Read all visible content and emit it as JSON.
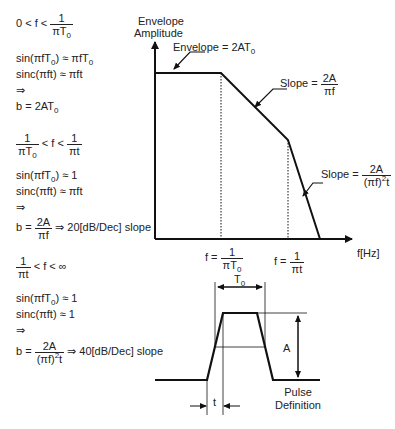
{
  "left_panel": {
    "region1": {
      "condition": {
        "lhs": "0 < f <",
        "num": "1",
        "den": "πT",
        "den_sub": "0"
      },
      "line1": {
        "pre": "sin(πfT",
        "sub1": "0",
        "mid": ") ≈ πfT",
        "sub2": "0"
      },
      "line2": "sinc(πft) ≈ πft",
      "implies": "⇒",
      "result": {
        "pre": "b = 2AT",
        "sub": "0"
      }
    },
    "region2": {
      "condition": {
        "num1": "1",
        "den1": "πT",
        "den1_sub": "0",
        "mid": "< f <",
        "num2": "1",
        "den2": "πt"
      },
      "line1": {
        "pre": "sin(πfT",
        "sub": "0",
        "post": ") ≈ 1"
      },
      "line2": "sinc(πft) ≈ πft",
      "implies": "⇒",
      "result": {
        "pre": "b =",
        "num": "2A",
        "den": "πf",
        "post": "⇒ 20[dB/Dec] slope"
      }
    },
    "region3": {
      "condition": {
        "num": "1",
        "den": "πt",
        "post": "< f < ∞"
      },
      "line1": {
        "pre": "sin(πfT",
        "sub": "0",
        "post": ") ≈ 1"
      },
      "line2": "sinc(πft) ≈ 1",
      "implies": "⇒",
      "result": {
        "pre": "b =",
        "num": "2A",
        "den": "(πf)",
        "den_sup": "2",
        "den_post": "t",
        "post": "⇒ 40[dB/Dec] slope"
      }
    }
  },
  "chart": {
    "y_axis_label_1": "Envelope",
    "y_axis_label_2": "Amplitude",
    "x_axis_label": "f[Hz]",
    "envelope_label": {
      "pre": "Envelope = 2AT",
      "sub": "0"
    },
    "slope1_label": {
      "pre": "Slope =",
      "num": "2A",
      "den": "πf"
    },
    "slope2_label": {
      "pre": "Slope =",
      "num": "2A",
      "den": "(πf)",
      "den_sup": "2",
      "den_post": "t"
    },
    "corner1": {
      "pre": "f =",
      "num": "1",
      "den": "πT",
      "den_sub": "0"
    },
    "corner2": {
      "pre": "f =",
      "num": "1",
      "den": "πt"
    }
  },
  "pulse": {
    "width_label": {
      "pre": "T",
      "sub": "0"
    },
    "amplitude_label": "A",
    "rise_label": "t",
    "caption_1": "Pulse",
    "caption_2": "Definition"
  },
  "colors": {
    "line": "#111111",
    "text": "#222222",
    "background": "#ffffff"
  }
}
